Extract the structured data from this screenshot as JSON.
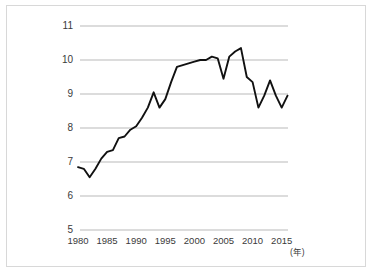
{
  "chart_data": {
    "type": "line",
    "title": "",
    "subtitle": "",
    "xlabel": "(年)",
    "ylabel": "",
    "xlim": [
      1979,
      2017
    ],
    "ylim": [
      5,
      11
    ],
    "grid": true,
    "legend": null,
    "y_ticks": [
      "11",
      "10",
      "9",
      "8",
      "7",
      "6",
      "5"
    ],
    "y_tick_values": [
      11,
      10,
      9,
      8,
      7,
      6,
      5
    ],
    "x_ticks": [
      "1980",
      "1985",
      "1990",
      "1995",
      "2000",
      "2005",
      "2010",
      "2015"
    ],
    "x_tick_values": [
      1980,
      1985,
      1990,
      1995,
      2000,
      2005,
      2010,
      2015
    ],
    "series": [
      {
        "name": "series-1",
        "color": "#111111",
        "x": [
          1980,
          1981,
          1982,
          1983,
          1984,
          1985,
          1986,
          1987,
          1988,
          1989,
          1990,
          1991,
          1992,
          1993,
          1994,
          1995,
          1996,
          1997,
          1998,
          1999,
          2000,
          2001,
          2002,
          2003,
          2004,
          2005,
          2006,
          2007,
          2008,
          2009,
          2010,
          2011,
          2012,
          2013,
          2014,
          2015,
          2016
        ],
        "values": [
          6.85,
          6.8,
          6.55,
          6.8,
          7.1,
          7.3,
          7.35,
          7.7,
          7.75,
          7.95,
          8.05,
          8.3,
          8.6,
          9.05,
          8.6,
          8.85,
          9.35,
          9.8,
          9.85,
          9.9,
          9.95,
          10.0,
          10.0,
          10.1,
          10.05,
          9.45,
          10.1,
          10.25,
          10.35,
          9.5,
          9.35,
          8.6,
          8.95,
          9.4,
          8.95,
          8.6,
          8.95
        ]
      }
    ]
  },
  "axes": {
    "unit_label": "(年)"
  }
}
